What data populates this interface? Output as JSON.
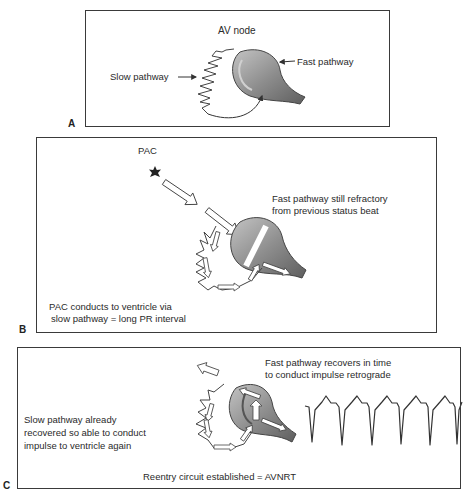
{
  "panels": [
    {
      "letter": "A",
      "labels": {
        "node": "AV node",
        "slow": "Slow pathway",
        "fast": "Fast pathway"
      }
    },
    {
      "letter": "B",
      "labels": {
        "trigger": "PAC",
        "fast_line1": "Fast pathway still refractory",
        "fast_line2": "from previous status beat",
        "slow_line1": "PAC conducts to ventricle via",
        "slow_line2": "slow pathway = long PR interval"
      }
    },
    {
      "letter": "C",
      "labels": {
        "fast_line1": "Fast pathway recovers in time",
        "fast_line2": "to conduct impulse retrograde",
        "slow_line1": "Slow pathway already",
        "slow_line2": "recovered so able to conduct",
        "slow_line3": "impulse to ventricle again",
        "conclusion": "Reentry circuit established = AVNRT"
      },
      "ecg": {
        "beats": 6,
        "rhythm": "narrow-complex tachycardia"
      }
    }
  ],
  "colors": {
    "node_fill": "#8a8a8a",
    "node_highlight": "#b8b8b8",
    "outline": "#3a3a3a",
    "text": "#2a2a2a"
  }
}
